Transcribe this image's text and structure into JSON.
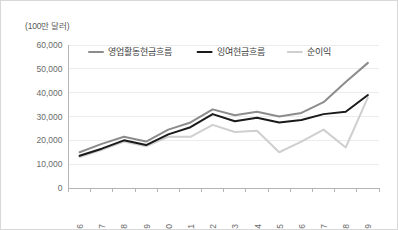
{
  "chart_data": {
    "type": "line",
    "title": "",
    "unit_label": "(100만 달러)",
    "xlabel": "",
    "ylabel": "",
    "categories": [
      "2006",
      "2007",
      "2008",
      "2009",
      "2010",
      "2011",
      "2012",
      "2013",
      "2014",
      "2015",
      "2016",
      "2017",
      "2018",
      "2019"
    ],
    "ylim": [
      0,
      60000
    ],
    "ytick_labels": [
      "60,000",
      "50,000",
      "40,000",
      "30,000",
      "20,000",
      "10,000",
      "0"
    ],
    "ytick_values": [
      60000,
      50000,
      40000,
      30000,
      20000,
      10000,
      0
    ],
    "grid": true,
    "legend_position": "top",
    "series": [
      {
        "name": "영업활동현금흐름",
        "color": "#8c8c8c",
        "width": 2,
        "values": [
          15000,
          18500,
          21500,
          19500,
          24500,
          27500,
          33000,
          30500,
          32000,
          30000,
          31500,
          36000,
          44500,
          52500
        ]
      },
      {
        "name": "잉여현금흐름",
        "color": "#1a1a1a",
        "width": 2,
        "values": [
          13500,
          16500,
          20000,
          18000,
          22500,
          25500,
          31000,
          28000,
          29500,
          27500,
          28500,
          31000,
          32000,
          39000
        ]
      },
      {
        "name": "순이익",
        "color": "#cfcfcf",
        "width": 2,
        "values": [
          13000,
          16000,
          19500,
          17500,
          21500,
          21500,
          26500,
          23500,
          24000,
          15000,
          19500,
          24500,
          17000,
          38000
        ]
      }
    ]
  }
}
